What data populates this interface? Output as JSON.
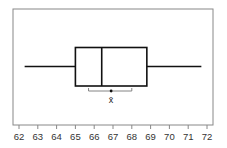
{
  "chart_data": {
    "type": "boxplot",
    "title": "",
    "xlabel": "",
    "ylabel": "",
    "xlim": [
      62,
      72
    ],
    "x_ticks": [
      62,
      63,
      64,
      65,
      66,
      67,
      68,
      69,
      70,
      71,
      72
    ],
    "tick_labels": [
      "62",
      "63",
      "64",
      "65",
      "66",
      "67",
      "68",
      "69",
      "70",
      "71",
      "72"
    ],
    "grid": false,
    "box": {
      "min": 62.3,
      "q1": 65.0,
      "median": 66.4,
      "q3": 68.8,
      "max": 71.7
    },
    "mean": {
      "value": 66.9,
      "label": "x̄",
      "interval_low": 65.7,
      "interval_high": 68.0
    }
  },
  "colors": {
    "box_stroke": "#111111",
    "frame_stroke": "#888888",
    "interval_stroke": "#777777"
  }
}
